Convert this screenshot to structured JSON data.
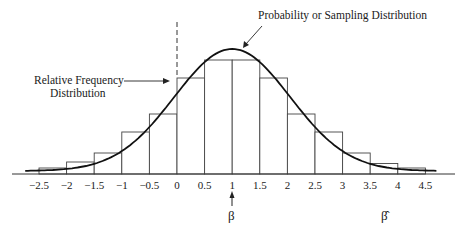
{
  "chart_data": {
    "type": "bar",
    "title": "",
    "xlabel": "β̂",
    "ylabel": "",
    "x_ticks": [
      "-2.5",
      "-2",
      "-1.5",
      "-1",
      "-0.5",
      "0",
      "0.5",
      "1",
      "1.5",
      "2",
      "2.5",
      "3",
      "3.5",
      "4",
      "4.5"
    ],
    "bins": [
      {
        "from": -2.5,
        "to": -2.0,
        "height": 0.02
      },
      {
        "from": -2.0,
        "to": -1.5,
        "height": 0.04
      },
      {
        "from": -1.5,
        "to": -1.0,
        "height": 0.07
      },
      {
        "from": -1.0,
        "to": -0.5,
        "height": 0.14
      },
      {
        "from": -0.5,
        "to": 0.0,
        "height": 0.2
      },
      {
        "from": 0.0,
        "to": 0.5,
        "height": 0.32
      },
      {
        "from": 0.5,
        "to": 1.0,
        "height": 0.38
      },
      {
        "from": 1.0,
        "to": 1.5,
        "height": 0.38
      },
      {
        "from": 1.5,
        "to": 2.0,
        "height": 0.32
      },
      {
        "from": 2.0,
        "to": 2.5,
        "height": 0.2
      },
      {
        "from": 2.5,
        "to": 3.0,
        "height": 0.14
      },
      {
        "from": 3.0,
        "to": 3.5,
        "height": 0.07
      },
      {
        "from": 3.5,
        "to": 4.0,
        "height": 0.035
      },
      {
        "from": 4.0,
        "to": 4.5,
        "height": 0.02
      }
    ],
    "series": [
      {
        "name": "Relative Frequency Distribution",
        "kind": "histogram"
      },
      {
        "name": "Probability or Sampling Distribution",
        "kind": "normal-curve",
        "mean": 1,
        "peak_x": 1
      }
    ],
    "annotations": [
      {
        "text": "Probability or Sampling Distribution",
        "points_to": "curve peak"
      },
      {
        "text": "Relative Frequency Distribution",
        "points_to": "histogram bar at 0"
      },
      {
        "text": "β",
        "at_x": 1,
        "note": "true parameter marked with arrow"
      },
      {
        "text": "β̂",
        "note": "estimator axis label"
      }
    ],
    "reference_line": {
      "x": 0,
      "style": "dashed"
    },
    "xlim": [
      -2.5,
      4.5
    ],
    "grid": false,
    "legend": "none"
  },
  "labels": {
    "curve_label": "Probability or Sampling Distribution",
    "hist_label_line1": "Relative Frequency",
    "hist_label_line2": "Distribution",
    "beta_true": "β",
    "beta_hat": "β̂",
    "ticks": [
      "−2.5",
      "−2",
      "−1.5",
      "−1",
      "−0.5",
      "0",
      "0.5",
      "1",
      "1.5",
      "2",
      "2.5",
      "3",
      "3.5",
      "4",
      "4.5"
    ]
  }
}
